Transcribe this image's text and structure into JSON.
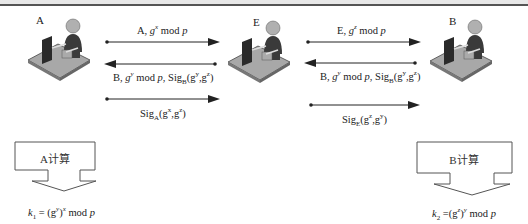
{
  "header": {
    "title": ""
  },
  "nodes": [
    {
      "id": "A",
      "label": "A"
    },
    {
      "id": "E",
      "label": "E"
    },
    {
      "id": "B",
      "label": "B"
    }
  ],
  "messages": {
    "a_to_e_1": {
      "prefix": "A, ",
      "g": "g",
      "exp": "x",
      "suffix": " mod ",
      "p": "p"
    },
    "e_to_a_2": {
      "prefix": "B, ",
      "g": "g",
      "exp": "y",
      "mid": " mod ",
      "p": "p",
      "sig": ", Sig",
      "sigsub": "B",
      "args": "(g",
      "a1": "y",
      "comma": ",g",
      "a2": "z",
      "close": ")"
    },
    "a_to_e_3": {
      "sig": "Sig",
      "sigsub": "A",
      "args": "(g",
      "a1": "x",
      "comma": ",g",
      "a2": "z",
      "close": ")"
    },
    "e_to_b_1": {
      "prefix": "E, ",
      "g": "g",
      "exp": "z",
      "suffix": " mod ",
      "p": "p"
    },
    "b_to_e_2": {
      "prefix": "B, ",
      "g": "g",
      "exp": "y",
      "mid": " mod ",
      "p": "p",
      "sig": ", Sig",
      "sigsub": "B",
      "args": "(g",
      "a1": "y",
      "comma": ",g",
      "a2": "z",
      "close": ")"
    },
    "e_to_b_3": {
      "sig": "Sig",
      "sigsub": "E",
      "args": "(g",
      "a1": "z",
      "comma": ",g",
      "a2": "y",
      "close": ")"
    }
  },
  "callouts": {
    "a": {
      "label": "A计算",
      "formula": {
        "k": "k",
        "ksub": "1",
        "eq": " = (g",
        "inner": "y",
        "paren": ")",
        "outer": "x",
        "tail": " mod ",
        "p": "p"
      }
    },
    "b": {
      "label": "B计算",
      "formula": {
        "k": "k",
        "ksub": "2",
        "eq": " =(g",
        "inner": "z",
        "paren": ")",
        "outer": "y",
        "tail": " mod ",
        "p": "p"
      }
    }
  },
  "colors": {
    "line": "#222222",
    "box_stroke": "#555555",
    "desk": "#9a9a9a",
    "person": "#555555"
  }
}
